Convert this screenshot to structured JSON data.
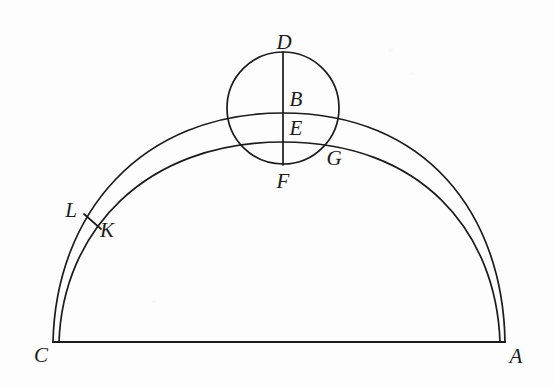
{
  "figure": {
    "background_color": "#fdfdfd",
    "stroke_color": "#1b1b1b",
    "labels": {
      "A": "A",
      "B": "B",
      "C": "C",
      "D": "D",
      "E": "E",
      "F": "F",
      "G": "G",
      "K": "K",
      "L": "L"
    },
    "label_positions": {
      "A": {
        "x": 516,
        "y": 356
      },
      "B": {
        "x": 296,
        "y": 99
      },
      "C": {
        "x": 41,
        "y": 355
      },
      "D": {
        "x": 284,
        "y": 42
      },
      "E": {
        "x": 296,
        "y": 128
      },
      "F": {
        "x": 283,
        "y": 181
      },
      "G": {
        "x": 334,
        "y": 158
      },
      "K": {
        "x": 107,
        "y": 230
      },
      "L": {
        "x": 71,
        "y": 210
      }
    },
    "points": {
      "A": {
        "x": 505,
        "y": 342
      },
      "C": {
        "x": 53,
        "y": 342
      },
      "D": {
        "x": 283,
        "y": 53
      },
      "F": {
        "x": 283,
        "y": 164
      },
      "B": {
        "x": 283,
        "y": 113
      },
      "E": {
        "x": 283,
        "y": 142
      },
      "G": {
        "x": 327,
        "y": 150
      },
      "L": {
        "x": 85,
        "y": 216
      },
      "K": {
        "x": 99,
        "y": 227
      }
    },
    "circle": {
      "center_x": 283,
      "center_y": 108,
      "radius": 56
    },
    "baseline": {
      "x1": 53,
      "y1": 342,
      "x2": 505,
      "y2": 342
    },
    "outer_arc": {
      "from": "C",
      "to": "A",
      "apex": "B",
      "apex_y": 113
    },
    "inner_arc": {
      "from": "C",
      "to": "A",
      "apex": "E",
      "apex_y": 142
    },
    "diameter_segment": {
      "from": "D",
      "to": "F"
    },
    "chord_segment": {
      "from": "L",
      "to": "K"
    }
  }
}
